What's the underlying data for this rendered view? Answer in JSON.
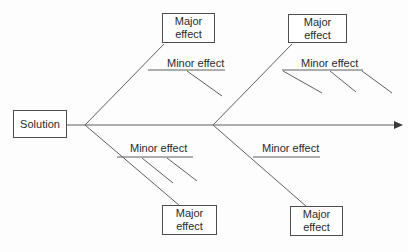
{
  "diagram": {
    "type": "fishbone",
    "solution_label": "Solution",
    "colors": {
      "line": "#5f5f5f",
      "box_border": "#4e4e4e",
      "text": "#2a2a2a",
      "background": "#fdfdfd",
      "arrowhead": "#3a3a3a"
    },
    "spine": {
      "has_right_arrowhead": true
    },
    "branches": [
      {
        "position": "upper-left",
        "major_label": "Major effect",
        "minor_label": "Minor effect",
        "sub_branch_count": 1
      },
      {
        "position": "upper-right",
        "major_label": "Major effect",
        "minor_label": "Minor effect",
        "sub_branch_count": 3
      },
      {
        "position": "lower-left",
        "major_label": "Major effect",
        "minor_label": "Minor effect",
        "sub_branch_count": 2
      },
      {
        "position": "lower-right",
        "major_label": "Major effect",
        "minor_label": "Minor effect",
        "sub_branch_count": 0
      }
    ]
  }
}
